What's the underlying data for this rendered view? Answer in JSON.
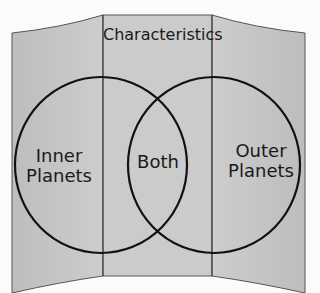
{
  "diagram": {
    "type": "venn-diagram-trifold",
    "header": "Characteristics",
    "sets": [
      {
        "id": "left",
        "label": "Inner Planets"
      },
      {
        "id": "overlap",
        "label": "Both"
      },
      {
        "id": "right",
        "label": "Outer Planets"
      }
    ],
    "inner_label_lines": [
      "Inner",
      "Planets"
    ],
    "outer_label_lines": [
      "Outer",
      "Planets"
    ],
    "colors": {
      "panel_fill": "#c9c9c9",
      "panel_outline": "#555555",
      "circle_stroke": "#111111",
      "background": "#fbfbfb"
    }
  }
}
